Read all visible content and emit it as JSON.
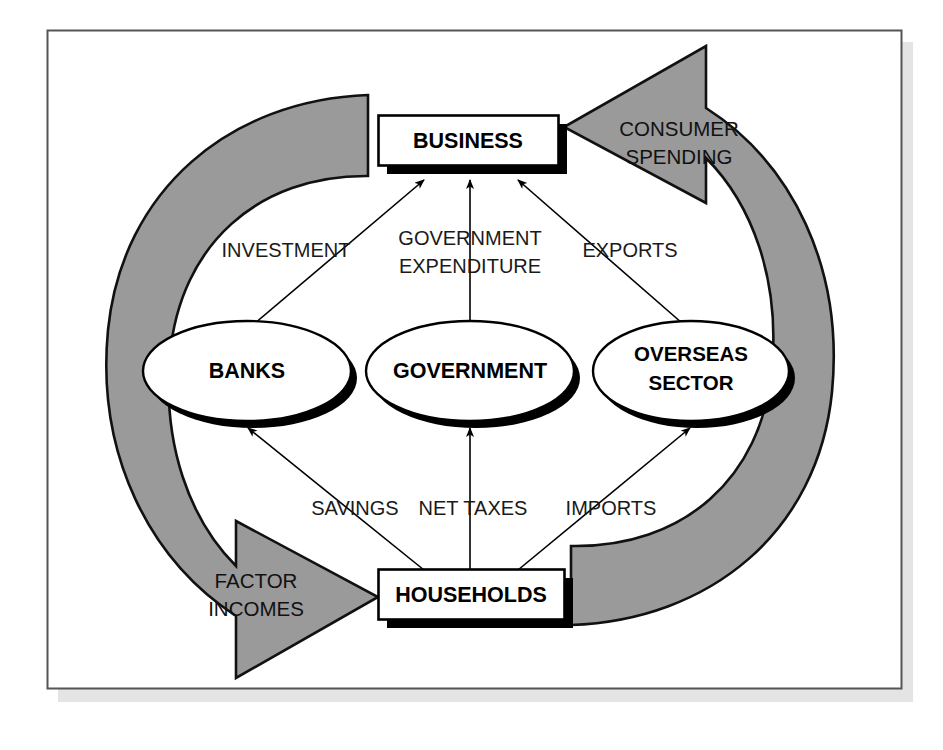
{
  "diagram": {
    "type": "circular-flow",
    "frame": {
      "border_color": "#555555",
      "background_color": "#ffffff",
      "shadow_color": "#e2e2e2"
    },
    "colors": {
      "band_gray": "#9a9a9a",
      "band_outline": "#111111",
      "node_fill": "#ffffff",
      "node_outline": "#000000",
      "node_shadow": "#000000",
      "text": "#000000"
    },
    "nodes": [
      {
        "id": "business",
        "label": "BUSINESS",
        "shape": "box"
      },
      {
        "id": "banks",
        "label": "BANKS",
        "shape": "ellipse"
      },
      {
        "id": "government",
        "label": "GOVERNMENT",
        "shape": "ellipse"
      },
      {
        "id": "overseas",
        "label": "OVERSEAS\nSECTOR",
        "shape": "ellipse",
        "line1": "OVERSEAS",
        "line2": "SECTOR"
      },
      {
        "id": "households",
        "label": "HOUSEHOLDS",
        "shape": "box"
      }
    ],
    "injections": [
      {
        "id": "investment",
        "label": "INVESTMENT",
        "from": "banks",
        "to": "business"
      },
      {
        "id": "govt-exp",
        "label": "GOVERNMENT\nEXPENDITURE",
        "line1": "GOVERNMENT",
        "line2": "EXPENDITURE",
        "from": "government",
        "to": "business"
      },
      {
        "id": "exports",
        "label": "EXPORTS",
        "from": "overseas",
        "to": "business"
      }
    ],
    "leakages": [
      {
        "id": "savings",
        "label": "SAVINGS",
        "from": "households",
        "to": "banks"
      },
      {
        "id": "net-taxes",
        "label": "NET TAXES",
        "from": "households",
        "to": "government"
      },
      {
        "id": "imports",
        "label": "IMPORTS",
        "from": "households",
        "to": "overseas"
      }
    ],
    "bands": [
      {
        "id": "factor-incomes",
        "label": "FACTOR\nINCOMES",
        "line1": "FACTOR",
        "line2": "INCOMES",
        "from": "business",
        "to": "households",
        "side": "left"
      },
      {
        "id": "consumer-spending",
        "label": "CONSUMER\nSPENDING",
        "line1": "CONSUMER",
        "line2": "SPENDING",
        "from": "households",
        "to": "business",
        "side": "right"
      }
    ]
  }
}
